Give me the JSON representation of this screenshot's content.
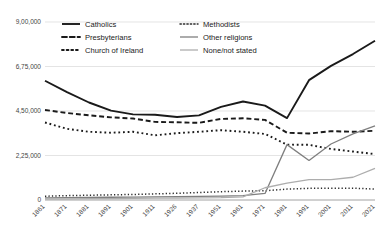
{
  "chart_data": {
    "type": "line",
    "title": "",
    "xlabel": "",
    "ylabel": "",
    "grid": true,
    "legend_position": "top",
    "ylim": [
      0,
      900000
    ],
    "yticks": [
      0,
      225000,
      450000,
      675000,
      900000
    ],
    "ytick_labels": [
      "0",
      "2,25,000",
      "4,50,000",
      "6,75,000",
      "9,00,000"
    ],
    "categories": [
      "1861",
      "1871",
      "1881",
      "1891",
      "1901",
      "1911",
      "1926",
      "1937",
      "1951",
      "1961",
      "1971",
      "1981",
      "1991",
      "2001",
      "2011",
      "2021"
    ],
    "series": [
      {
        "name": "Catholics",
        "style": "solid",
        "color": "#1a1a1a",
        "width": 1.9,
        "values": [
          603000,
          545000,
          493000,
          452000,
          433000,
          431000,
          420000,
          428000,
          471000,
          498000,
          477000,
          414000,
          606000,
          678000,
          738000,
          805000
        ]
      },
      {
        "name": "Presbyterians",
        "style": "dashed",
        "color": "#1a1a1a",
        "width": 1.9,
        "values": [
          455000,
          440000,
          428000,
          418000,
          412000,
          395000,
          393000,
          390000,
          410000,
          413000,
          405000,
          340000,
          336000,
          348000,
          345000,
          350000
        ]
      },
      {
        "name": "Church of Ireland",
        "style": "dotted",
        "color": "#1a1a1a",
        "width": 1.9,
        "values": [
          392000,
          360000,
          345000,
          340000,
          345000,
          327000,
          338000,
          345000,
          353000,
          345000,
          334000,
          280000,
          279000,
          258000,
          245000,
          232000
        ]
      },
      {
        "name": "Methodists",
        "style": "dotted-fine",
        "color": "#2b2b2b",
        "width": 1.5,
        "values": [
          19000,
          22000,
          24000,
          26000,
          28000,
          31000,
          34000,
          38000,
          42000,
          45000,
          47000,
          55000,
          59000,
          60000,
          60000,
          55000
        ]
      },
      {
        "name": "Other religions",
        "style": "solid",
        "color": "#7f7f7f",
        "width": 1.3,
        "values": [
          11000,
          12000,
          13000,
          14000,
          15000,
          16000,
          17000,
          18000,
          20000,
          22000,
          33000,
          280000,
          200000,
          283000,
          334000,
          375000
        ]
      },
      {
        "name": "None/not stated",
        "style": "solid",
        "color": "#adadad",
        "width": 1.3,
        "values": [
          6000,
          6000,
          7000,
          7000,
          8000,
          9000,
          10000,
          11000,
          12000,
          16000,
          62000,
          85000,
          103000,
          103000,
          115000,
          160000
        ]
      }
    ],
    "legend": [
      {
        "label": "Catholics",
        "style": "solid",
        "color": "#1a1a1a"
      },
      {
        "label": "Methodists",
        "style": "dotted-fine",
        "color": "#2b2b2b"
      },
      {
        "label": "Presbyterians",
        "style": "dashed",
        "color": "#1a1a1a"
      },
      {
        "label": "Other religions",
        "style": "solid",
        "color": "#7f7f7f"
      },
      {
        "label": "Church of Ireland",
        "style": "dotted",
        "color": "#1a1a1a"
      },
      {
        "label": "None/not stated",
        "style": "solid",
        "color": "#adadad"
      }
    ]
  }
}
